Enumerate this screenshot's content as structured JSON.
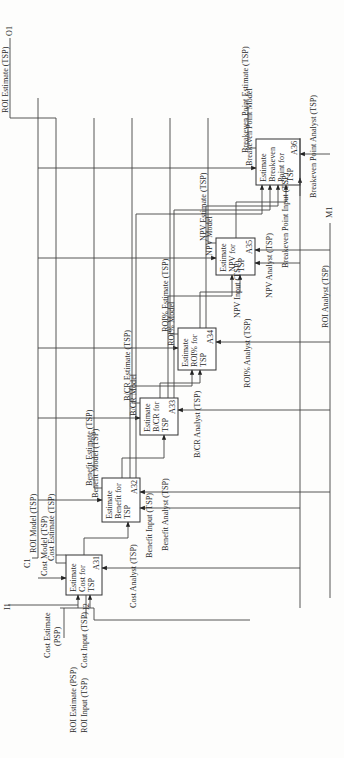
{
  "diagram": {
    "type": "IDEF0",
    "orientation": "rotated-90-ccw",
    "boundary_tags": {
      "inputs": [
        "I1",
        "I2"
      ],
      "controls": [
        "C1"
      ],
      "outputs": [
        "O1"
      ],
      "mechanisms": [
        "M1"
      ]
    },
    "activities": [
      {
        "id": "A31",
        "title": "Estimate Cost for TSP",
        "lines": [
          "Estimate",
          "Cost for",
          "TSP"
        ]
      },
      {
        "id": "A32",
        "title": "Estimate Benefit for TSP",
        "lines": [
          "Estimate",
          "Benefit for",
          "TSP"
        ]
      },
      {
        "id": "A33",
        "title": "Estimate B/CR for TSP",
        "lines": [
          "Estimate",
          "B/CR for",
          "TSP"
        ]
      },
      {
        "id": "A34",
        "title": "Estimate ROI% for TSP",
        "lines": [
          "Estimate",
          "ROI% for",
          "TSP"
        ]
      },
      {
        "id": "A35",
        "title": "Estimate NPV for TSP",
        "lines": [
          "Estimate",
          "NPV for",
          "TSP"
        ]
      },
      {
        "id": "A36",
        "title": "Estimate Breakeven Point for TSP",
        "lines": [
          "Estimate",
          "Breakeven",
          "Point for",
          "TSP"
        ]
      }
    ],
    "arrows": {
      "roi_estimate_psp": "ROI Estimate (PSP)",
      "roi_input_tsp": "ROI Input (TSP)",
      "cost_input_tsp": "Cost Input (TSP)",
      "cost_estimate_psp": "Cost Estimate (PSP)",
      "cost_estimate_psp_l1": "Cost Estimate",
      "cost_estimate_psp_l2": "(PSP)",
      "roi_model_tsp": "ROI Model (TSP)",
      "cost_model_tsp": "Cost Model (TSP)",
      "cost_estimate_tsp": "Cost Estimate (TSP)",
      "cost_analyst_tsp": "Cost Analyst (TSP)",
      "benefit_model_tsp": "Benefit Model (TSP)",
      "benefit_estimate_tsp": "Benefit Estimate (TSP)",
      "benefit_input_tsp": "Benefit Input (TSP)",
      "benefit_analyst_tsp": "Benefit Analyst (TSP)",
      "bcr_model": "B/CR Model",
      "bcr_estimate_tsp": "B/CR Estimate (TSP)",
      "bcr_analyst_tsp": "B/CR Analyst (TSP)",
      "roi_pct_model": "ROI% Model",
      "roi_pct_estimate_tsp": "ROI% Estimate (TSP)",
      "roi_pct_analyst_tsp": "ROI% Analyst (TSP)",
      "npv_model": "NPV Model",
      "npv_estimate_tsp": "NPV Estimate (TSP)",
      "npv_input_tsp": "NPV Input (TSP)",
      "npv_analyst_tsp": "NPV Analyst (TSP)",
      "breakeven_point_model": "Breakeven Point Model",
      "breakeven_point_input_tsp": "Breakeven Point Input (TSP)",
      "breakeven_point_analyst_tsp": "Breakeven Point Analyst (TSP)",
      "breakeven_point_estimate_tsp": "Breakeven Point Estimate (TSP)",
      "roi_estimate_tsp": "ROI Estimate (TSP)",
      "roi_analyst_tsp": "ROI Analyst (TSP)"
    }
  }
}
